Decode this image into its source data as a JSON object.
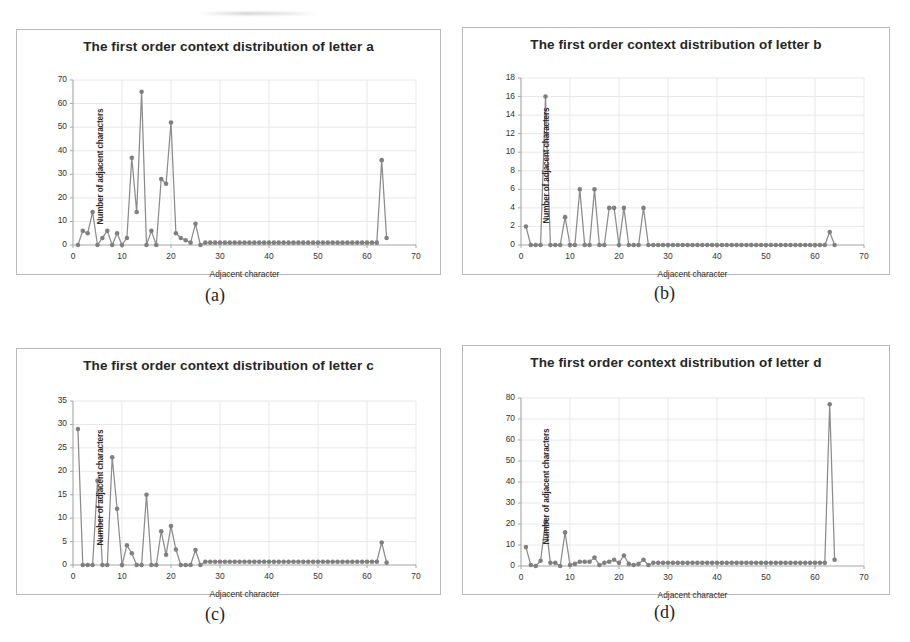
{
  "figure": {
    "axis_label_x": "Adjacent character",
    "axis_label_y": "Number of adjacent characters",
    "marker_color": "#808080",
    "line_color": "#8c8c8c",
    "grid_color": "#e8e8e8",
    "axis_color": "#a6a6a6",
    "captions": {
      "a": "(a)",
      "b": "(b)",
      "c": "(c)",
      "d": "(d)"
    }
  },
  "chart_data": [
    {
      "id": "a",
      "type": "line",
      "title": "The first order context distribution of letter a",
      "xlabel": "Adjacent character",
      "ylabel": "Number of adjacent characters",
      "xlim": [
        0,
        70
      ],
      "ylim": [
        0,
        70
      ],
      "xticks": [
        0,
        10,
        20,
        30,
        40,
        50,
        60,
        70
      ],
      "yticks": [
        0,
        10,
        20,
        30,
        40,
        50,
        60,
        70
      ],
      "grid": true,
      "legend": "none",
      "markers": true,
      "x": [
        1,
        2,
        3,
        4,
        5,
        6,
        7,
        8,
        9,
        10,
        11,
        12,
        13,
        14,
        15,
        16,
        17,
        18,
        19,
        20,
        21,
        22,
        23,
        24,
        25,
        26,
        27,
        28,
        29,
        30,
        31,
        32,
        33,
        34,
        35,
        36,
        37,
        38,
        39,
        40,
        41,
        42,
        43,
        44,
        45,
        46,
        47,
        48,
        49,
        50,
        51,
        52,
        53,
        54,
        55,
        56,
        57,
        58,
        59,
        60,
        61,
        62,
        63,
        64
      ],
      "values": [
        0,
        6,
        5,
        14,
        0,
        3,
        6,
        0,
        5,
        0,
        3,
        37,
        14,
        65,
        0,
        6,
        0,
        28,
        26,
        52,
        5,
        3,
        2,
        1,
        9,
        0,
        1,
        1,
        1,
        1,
        1,
        1,
        1,
        1,
        1,
        1,
        1,
        1,
        1,
        1,
        1,
        1,
        1,
        1,
        1,
        1,
        1,
        1,
        1,
        1,
        1,
        1,
        1,
        1,
        1,
        1,
        1,
        1,
        1,
        1,
        1,
        1,
        36,
        3
      ]
    },
    {
      "id": "b",
      "type": "line",
      "title": "The first order context distribution of letter b",
      "xlabel": "Adjacent character",
      "ylabel": "Number of adjacent characters",
      "xlim": [
        0,
        70
      ],
      "ylim": [
        0,
        18
      ],
      "xticks": [
        0,
        10,
        20,
        30,
        40,
        50,
        60,
        70
      ],
      "yticks": [
        0,
        2,
        4,
        6,
        8,
        10,
        12,
        14,
        16,
        18
      ],
      "grid": true,
      "legend": "none",
      "markers": true,
      "x": [
        1,
        2,
        3,
        4,
        5,
        6,
        7,
        8,
        9,
        10,
        11,
        12,
        13,
        14,
        15,
        16,
        17,
        18,
        19,
        20,
        21,
        22,
        23,
        24,
        25,
        26,
        27,
        28,
        29,
        30,
        31,
        32,
        33,
        34,
        35,
        36,
        37,
        38,
        39,
        40,
        41,
        42,
        43,
        44,
        45,
        46,
        47,
        48,
        49,
        50,
        51,
        52,
        53,
        54,
        55,
        56,
        57,
        58,
        59,
        60,
        61,
        62,
        63,
        64
      ],
      "values": [
        2,
        0,
        0,
        0,
        16,
        0,
        0,
        0,
        3,
        0,
        0,
        6,
        0,
        0,
        6,
        0,
        0,
        4,
        4,
        0,
        4,
        0,
        0,
        0,
        4,
        0,
        0,
        0,
        0,
        0,
        0,
        0,
        0,
        0,
        0,
        0,
        0,
        0,
        0,
        0,
        0,
        0,
        0,
        0,
        0,
        0,
        0,
        0,
        0,
        0,
        0,
        0,
        0,
        0,
        0,
        0,
        0,
        0,
        0,
        0,
        0,
        0,
        1.4,
        0
      ]
    },
    {
      "id": "c",
      "type": "line",
      "title": "The first order context distribution of letter c",
      "xlabel": "Adjacent character",
      "ylabel": "Number of adjacent characters",
      "xlim": [
        0,
        70
      ],
      "ylim": [
        0,
        35
      ],
      "xticks": [
        0,
        10,
        20,
        30,
        40,
        50,
        60,
        70
      ],
      "yticks": [
        0,
        5,
        10,
        15,
        20,
        25,
        30,
        35
      ],
      "grid": true,
      "legend": "none",
      "markers": true,
      "x": [
        1,
        2,
        3,
        4,
        5,
        6,
        7,
        8,
        9,
        10,
        11,
        12,
        13,
        14,
        15,
        16,
        17,
        18,
        19,
        20,
        21,
        22,
        23,
        24,
        25,
        26,
        27,
        28,
        29,
        30,
        31,
        32,
        33,
        34,
        35,
        36,
        37,
        38,
        39,
        40,
        41,
        42,
        43,
        44,
        45,
        46,
        47,
        48,
        49,
        50,
        51,
        52,
        53,
        54,
        55,
        56,
        57,
        58,
        59,
        60,
        61,
        62,
        63,
        64
      ],
      "values": [
        29,
        0,
        0,
        0,
        18,
        0,
        0,
        23,
        12,
        0,
        4.2,
        2.5,
        0,
        0,
        15,
        0,
        0,
        7.2,
        2.2,
        8.3,
        3.3,
        0,
        0,
        0,
        3.2,
        0,
        0.7,
        0.7,
        0.7,
        0.7,
        0.7,
        0.7,
        0.7,
        0.7,
        0.7,
        0.7,
        0.7,
        0.7,
        0.7,
        0.7,
        0.7,
        0.7,
        0.7,
        0.7,
        0.7,
        0.7,
        0.7,
        0.7,
        0.7,
        0.7,
        0.7,
        0.7,
        0.7,
        0.7,
        0.7,
        0.7,
        0.7,
        0.7,
        0.7,
        0.7,
        0.7,
        0.7,
        4.8,
        0.5
      ]
    },
    {
      "id": "d",
      "type": "line",
      "title": "The first order context distribution of letter d",
      "xlabel": "Adjacent character",
      "ylabel": "Number of adjacent characters",
      "xlim": [
        0,
        70
      ],
      "ylim": [
        0,
        80
      ],
      "xticks": [
        0,
        10,
        20,
        30,
        40,
        50,
        60,
        70
      ],
      "yticks": [
        0,
        10,
        20,
        30,
        40,
        50,
        60,
        70,
        80
      ],
      "grid": true,
      "legend": "none",
      "markers": true,
      "x": [
        1,
        2,
        3,
        4,
        5,
        6,
        7,
        8,
        9,
        10,
        11,
        12,
        13,
        14,
        15,
        16,
        17,
        18,
        19,
        20,
        21,
        22,
        23,
        24,
        25,
        26,
        27,
        28,
        29,
        30,
        31,
        32,
        33,
        34,
        35,
        36,
        37,
        38,
        39,
        40,
        41,
        42,
        43,
        44,
        45,
        46,
        47,
        48,
        49,
        50,
        51,
        52,
        53,
        54,
        55,
        56,
        57,
        58,
        59,
        60,
        61,
        62,
        63,
        64
      ],
      "values": [
        9,
        0.5,
        0,
        2.5,
        21,
        1.5,
        1.5,
        0,
        16,
        0.5,
        1,
        2,
        2,
        2,
        4,
        0.5,
        1.5,
        2,
        3,
        1.5,
        5,
        1,
        0.5,
        1,
        3,
        0.5,
        1.5,
        1.5,
        1.5,
        1.5,
        1.5,
        1.5,
        1.5,
        1.5,
        1.5,
        1.5,
        1.5,
        1.5,
        1.5,
        1.5,
        1.5,
        1.5,
        1.5,
        1.5,
        1.5,
        1.5,
        1.5,
        1.5,
        1.5,
        1.5,
        1.5,
        1.5,
        1.5,
        1.5,
        1.5,
        1.5,
        1.5,
        1.5,
        1.5,
        1.5,
        1.5,
        1.5,
        77,
        3
      ]
    }
  ]
}
